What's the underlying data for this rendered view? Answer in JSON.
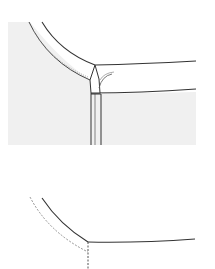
{
  "diagram": {
    "type": "line-illustration",
    "panels": [
      {
        "id": "top",
        "description": "Shaded garment body with curved neckline binding meeting straight collar band, folded corner and vertical placket"
      },
      {
        "id": "bottom",
        "description": "Outline of curved neckline meeting straight edge, with dashed seam allowance line and dashed vertical line"
      }
    ]
  },
  "colors": {
    "background": "#ffffff",
    "fabric_shade": "#f0f0f0",
    "line": "#333333",
    "dashed_line": "#888888"
  }
}
